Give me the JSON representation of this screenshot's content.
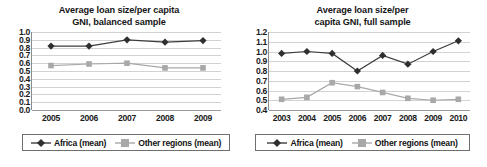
{
  "figure": {
    "panels": [
      {
        "id": "balanced-sample",
        "title_line1": "Average loan size/per capita",
        "title_line2": "GNI, balanced sample",
        "legend": {
          "africa_label": "Africa (mean)",
          "other_label": "Other regions (mean)"
        }
      },
      {
        "id": "full-sample",
        "title_line1": "Average loan size/per",
        "title_line2": "capita GNI, full sample",
        "legend": {
          "africa_label": "Africa (mean)",
          "other_label": "Other regions (mean)"
        }
      }
    ],
    "colors": {
      "africa_series": "#3d3d3d",
      "other_series": "#a8a8a8",
      "gridline": "#d2d2d2",
      "axis": "#8c8c8c",
      "text": "#1a1a1a"
    }
  },
  "chart_data": [
    {
      "type": "line",
      "id": "balanced-sample",
      "title": "Average loan size/per capita GNI, balanced sample",
      "xlabel": "",
      "ylabel": "",
      "categories": [
        "2005",
        "2006",
        "2007",
        "2008",
        "2009"
      ],
      "ylim": [
        0.0,
        1.0
      ],
      "yticks": [
        "1.0",
        "0.9",
        "0.8",
        "0.7",
        "0.6",
        "0.5",
        "0.4",
        "0.3",
        "0.2",
        "0.1",
        "0.0"
      ],
      "ytick_values": [
        1.0,
        0.9,
        0.8,
        0.7,
        0.6,
        0.5,
        0.4,
        0.3,
        0.2,
        0.1,
        0.0
      ],
      "grid": true,
      "legend_position": "bottom",
      "series": [
        {
          "name": "Africa (mean)",
          "marker": "diamond",
          "values": [
            0.82,
            0.82,
            0.9,
            0.87,
            0.89
          ]
        },
        {
          "name": "Other regions (mean)",
          "marker": "square",
          "values": [
            0.57,
            0.59,
            0.6,
            0.54,
            0.54
          ]
        }
      ]
    },
    {
      "type": "line",
      "id": "full-sample",
      "title": "Average loan size/per capita GNI, full sample",
      "xlabel": "",
      "ylabel": "",
      "categories": [
        "2003",
        "2004",
        "2005",
        "2006",
        "2007",
        "2008",
        "2009",
        "2010"
      ],
      "ylim": [
        0.4,
        1.2
      ],
      "yticks": [
        "1.2",
        "1.1",
        "1.0",
        "0.9",
        "0.8",
        "0.7",
        "0.6",
        "0.5",
        "0.4"
      ],
      "ytick_values": [
        1.2,
        1.1,
        1.0,
        0.9,
        0.8,
        0.7,
        0.6,
        0.5,
        0.4
      ],
      "grid": true,
      "legend_position": "bottom",
      "series": [
        {
          "name": "Africa (mean)",
          "marker": "diamond",
          "values": [
            0.98,
            1.0,
            0.98,
            0.8,
            0.96,
            0.87,
            1.0,
            1.11
          ]
        },
        {
          "name": "Other regions (mean)",
          "marker": "square",
          "values": [
            0.51,
            0.53,
            0.68,
            0.64,
            0.58,
            0.52,
            0.5,
            0.51
          ]
        }
      ]
    }
  ]
}
